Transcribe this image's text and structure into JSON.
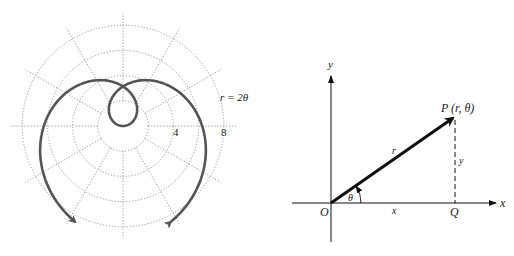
{
  "polar_plot": {
    "equation_label": "r = 2θ",
    "radius_labels": [
      "4",
      "8"
    ],
    "center": [
      123,
      126
    ],
    "pixels_per_unit": 12.6,
    "grid_circle_radii_units": [
      2,
      4,
      6,
      8
    ],
    "radial_line_step_deg": 30,
    "curve": {
      "function": "r = 2θ",
      "theta_max": 4.25,
      "color": "#555555"
    }
  },
  "cartesian_diagram": {
    "x_axis_label": "x",
    "y_axis_label": "y",
    "origin_label": "O",
    "point_label": "P (r, θ)",
    "foot_label": "Q",
    "radius_label": "r",
    "angle_label": "θ",
    "horizontal_leg_label": "x",
    "vertical_leg_label": "y"
  }
}
